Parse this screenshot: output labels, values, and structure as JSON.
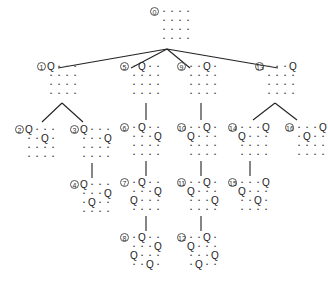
{
  "diagram": {
    "queen_symbol": "Q",
    "empty_symbol": "•",
    "line_color": "#222222",
    "nodes": [
      {
        "id": "0",
        "label": "⓪",
        "x": 150,
        "y": 7,
        "queens": []
      },
      {
        "id": "1",
        "label": "①",
        "x": 37,
        "y": 62,
        "queens": [
          [
            0,
            0
          ]
        ]
      },
      {
        "id": "2",
        "label": "②",
        "x": 15,
        "y": 125,
        "queens": [
          [
            0,
            0
          ],
          [
            1,
            2
          ]
        ]
      },
      {
        "id": "3",
        "label": "③",
        "x": 70,
        "y": 125,
        "queens": [
          [
            0,
            0
          ],
          [
            1,
            3
          ]
        ]
      },
      {
        "id": "4",
        "label": "④",
        "x": 70,
        "y": 180,
        "queens": [
          [
            0,
            0
          ],
          [
            1,
            3
          ],
          [
            2,
            1
          ]
        ]
      },
      {
        "id": "5",
        "label": "⑤",
        "x": 120,
        "y": 62,
        "queens": [
          [
            0,
            1
          ]
        ]
      },
      {
        "id": "6",
        "label": "⑥",
        "x": 120,
        "y": 123,
        "queens": [
          [
            0,
            1
          ],
          [
            1,
            3
          ]
        ]
      },
      {
        "id": "7",
        "label": "⑦",
        "x": 120,
        "y": 178,
        "queens": [
          [
            0,
            1
          ],
          [
            1,
            3
          ],
          [
            2,
            0
          ]
        ]
      },
      {
        "id": "8",
        "label": "⑧",
        "x": 120,
        "y": 233,
        "queens": [
          [
            0,
            1
          ],
          [
            1,
            3
          ],
          [
            2,
            0
          ],
          [
            3,
            2
          ]
        ]
      },
      {
        "id": "9",
        "label": "⑨",
        "x": 177,
        "y": 62,
        "queens": [
          [
            0,
            2
          ]
        ]
      },
      {
        "id": "10",
        "label": "⑩",
        "x": 177,
        "y": 123,
        "queens": [
          [
            0,
            2
          ],
          [
            1,
            0
          ]
        ]
      },
      {
        "id": "11",
        "label": "⑪",
        "x": 177,
        "y": 178,
        "queens": [
          [
            0,
            2
          ],
          [
            1,
            0
          ],
          [
            2,
            3
          ]
        ]
      },
      {
        "id": "12",
        "label": "⑫",
        "x": 177,
        "y": 233,
        "queens": [
          [
            0,
            2
          ],
          [
            1,
            0
          ],
          [
            2,
            3
          ],
          [
            3,
            1
          ]
        ]
      },
      {
        "id": "13",
        "label": "⑬",
        "x": 255,
        "y": 62,
        "queens": [
          [
            0,
            3
          ]
        ]
      },
      {
        "id": "14",
        "label": "⑭",
        "x": 228,
        "y": 123,
        "queens": [
          [
            0,
            3
          ],
          [
            1,
            0
          ]
        ]
      },
      {
        "id": "15",
        "label": "⑮",
        "x": 228,
        "y": 178,
        "queens": [
          [
            0,
            3
          ],
          [
            1,
            0
          ],
          [
            2,
            2
          ]
        ]
      },
      {
        "id": "16",
        "label": "⑯",
        "x": 285,
        "y": 123,
        "queens": [
          [
            0,
            3
          ],
          [
            1,
            1
          ]
        ]
      }
    ],
    "edges": [
      {
        "from": "0",
        "to": "1",
        "x1": 167,
        "y1": 49,
        "x2": 58,
        "y2": 68
      },
      {
        "from": "0",
        "to": "5",
        "x1": 167,
        "y1": 49,
        "x2": 131,
        "y2": 68
      },
      {
        "from": "0",
        "to": "9",
        "x1": 167,
        "y1": 49,
        "x2": 190,
        "y2": 68
      },
      {
        "from": "0",
        "to": "13",
        "x1": 167,
        "y1": 49,
        "x2": 278,
        "y2": 68
      },
      {
        "from": "1",
        "to": "2",
        "x1": 62,
        "y1": 103,
        "x2": 42,
        "y2": 122
      },
      {
        "from": "1",
        "to": "3",
        "x1": 62,
        "y1": 103,
        "x2": 83,
        "y2": 122
      },
      {
        "from": "3",
        "to": "4",
        "x1": 92,
        "y1": 163,
        "x2": 92,
        "y2": 178
      },
      {
        "from": "5",
        "to": "6",
        "x1": 146,
        "y1": 103,
        "x2": 146,
        "y2": 120
      },
      {
        "from": "6",
        "to": "7",
        "x1": 146,
        "y1": 161,
        "x2": 146,
        "y2": 176
      },
      {
        "from": "7",
        "to": "8",
        "x1": 146,
        "y1": 216,
        "x2": 146,
        "y2": 231
      },
      {
        "from": "9",
        "to": "10",
        "x1": 201,
        "y1": 103,
        "x2": 201,
        "y2": 120
      },
      {
        "from": "10",
        "to": "11",
        "x1": 201,
        "y1": 161,
        "x2": 201,
        "y2": 176
      },
      {
        "from": "11",
        "to": "12",
        "x1": 201,
        "y1": 216,
        "x2": 201,
        "y2": 231
      },
      {
        "from": "13",
        "to": "14",
        "x1": 275,
        "y1": 103,
        "x2": 253,
        "y2": 120
      },
      {
        "from": "13",
        "to": "15",
        "x1": 275,
        "y1": 103,
        "x2": 297,
        "y2": 120
      },
      {
        "from": "14",
        "to": "15",
        "x1": 250,
        "y1": 161,
        "x2": 250,
        "y2": 176
      }
    ]
  }
}
